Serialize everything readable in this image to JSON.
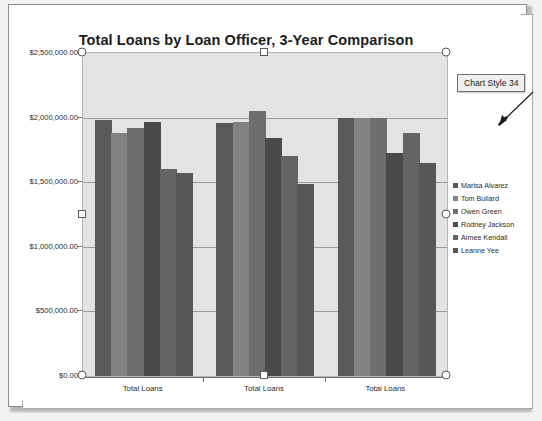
{
  "chart_data": {
    "type": "bar",
    "title": "Total Loans by Loan Officer, 3-Year Comparison",
    "xlabel": "",
    "ylabel": "",
    "categories": [
      "Total Loans",
      "Total Loans",
      "Total Loans"
    ],
    "ylim": [
      0,
      2500000
    ],
    "ytick_labels": [
      "$2,500,000.00",
      "$2,000,000.00",
      "$1,500,000.00",
      "$1,000,000.00",
      "$500,000.00",
      "$0.00"
    ],
    "ytick_values": [
      2500000,
      2000000,
      1500000,
      1000000,
      500000,
      0
    ],
    "grid": true,
    "legend_position": "right",
    "series": [
      {
        "name": "Marisa Alvarez",
        "color": "#595959",
        "values": [
          1985000,
          1960000,
          1995000
        ]
      },
      {
        "name": "Tom Bullard",
        "color": "#828282",
        "values": [
          1880000,
          1965000,
          1995000
        ]
      },
      {
        "name": "Owen Green",
        "color": "#6e6e6e",
        "values": [
          1920000,
          2055000,
          1995000
        ]
      },
      {
        "name": "Rodney Jackson",
        "color": "#4a4a4a",
        "values": [
          1965000,
          1840000,
          1725000
        ]
      },
      {
        "name": "Aimee Kendall",
        "color": "#646464",
        "values": [
          1605000,
          1705000,
          1880000
        ]
      },
      {
        "name": "Leanne Yee",
        "color": "#575757",
        "values": [
          1570000,
          1485000,
          1645000
        ]
      }
    ]
  },
  "callout": {
    "label": "Chart Style 34"
  },
  "selection": {
    "handle_name": "resize-handle"
  }
}
